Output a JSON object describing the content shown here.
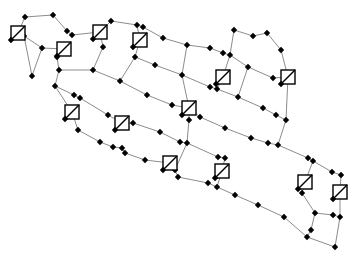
{
  "figure": {
    "width": 358,
    "height": 256,
    "background": "#ffffff",
    "kind": "network-diagram"
  },
  "style": {
    "edge_color": "#8c8c8c",
    "edge_width": 1,
    "node_color": "#000000",
    "node_half_size": 3.2,
    "sensor_size": 14,
    "sensor_fill": "#ffffff",
    "sensor_stroke": "#000000",
    "sensor_stroke_width": 1.4
  },
  "network": {
    "nodes": [
      [
        25,
        17
      ],
      [
        53,
        15
      ],
      [
        67,
        31
      ],
      [
        72,
        35
      ],
      [
        24,
        36
      ],
      [
        42,
        48
      ],
      [
        32,
        76
      ],
      [
        57,
        57
      ],
      [
        59,
        70
      ],
      [
        55,
        86
      ],
      [
        74,
        95
      ],
      [
        80,
        98
      ],
      [
        78,
        130
      ],
      [
        100,
        142
      ],
      [
        113,
        147
      ],
      [
        122,
        148
      ],
      [
        111,
        21
      ],
      [
        137,
        25
      ],
      [
        143,
        27
      ],
      [
        163,
        38
      ],
      [
        187,
        45
      ],
      [
        210,
        48
      ],
      [
        223,
        53
      ],
      [
        230,
        55
      ],
      [
        248,
        67
      ],
      [
        273,
        78
      ],
      [
        234,
        30
      ],
      [
        253,
        36
      ],
      [
        267,
        33
      ],
      [
        281,
        50
      ],
      [
        135,
        57
      ],
      [
        120,
        81
      ],
      [
        155,
        65
      ],
      [
        182,
        75
      ],
      [
        210,
        87
      ],
      [
        217,
        89
      ],
      [
        238,
        97
      ],
      [
        263,
        108
      ],
      [
        276,
        115
      ],
      [
        286,
        120
      ],
      [
        103,
        47
      ],
      [
        93,
        70
      ],
      [
        108,
        115
      ],
      [
        133,
        123
      ],
      [
        160,
        132
      ],
      [
        180,
        142
      ],
      [
        187,
        143
      ],
      [
        218,
        157
      ],
      [
        225,
        158
      ],
      [
        147,
        95
      ],
      [
        172,
        105
      ],
      [
        200,
        117
      ],
      [
        225,
        128
      ],
      [
        251,
        138
      ],
      [
        268,
        143
      ],
      [
        278,
        145
      ],
      [
        308,
        158
      ],
      [
        313,
        161
      ],
      [
        332,
        172
      ],
      [
        341,
        175
      ],
      [
        125,
        153
      ],
      [
        145,
        160
      ],
      [
        175,
        170
      ],
      [
        178,
        177
      ],
      [
        208,
        183
      ],
      [
        217,
        187
      ],
      [
        235,
        195
      ],
      [
        258,
        205
      ],
      [
        284,
        217
      ],
      [
        307,
        237
      ],
      [
        335,
        247
      ],
      [
        302,
        193
      ],
      [
        315,
        213
      ],
      [
        333,
        215
      ],
      [
        340,
        217
      ],
      [
        311,
        230
      ],
      [
        189,
        120
      ]
    ],
    "sensors": [
      [
        18,
        33
      ],
      [
        64,
        49
      ],
      [
        100,
        32
      ],
      [
        140,
        40
      ],
      [
        223,
        77
      ],
      [
        288,
        77
      ],
      [
        72,
        112
      ],
      [
        122,
        123
      ],
      [
        189,
        108
      ],
      [
        170,
        163
      ],
      [
        222,
        171
      ],
      [
        305,
        182
      ],
      [
        340,
        192
      ]
    ],
    "edges": [
      [
        "n0",
        "n1"
      ],
      [
        "n1",
        "n2"
      ],
      [
        "n2",
        "n3"
      ],
      [
        "n0",
        "s0"
      ],
      [
        "s0",
        "n4"
      ],
      [
        "n4",
        "n5"
      ],
      [
        "n4",
        "n6"
      ],
      [
        "n5",
        "n6"
      ],
      [
        "n5",
        "s1"
      ],
      [
        "n3",
        "s2"
      ],
      [
        "s2",
        "n16"
      ],
      [
        "n16",
        "n17"
      ],
      [
        "n17",
        "n18"
      ],
      [
        "n18",
        "n19"
      ],
      [
        "n19",
        "n20"
      ],
      [
        "n20",
        "n21"
      ],
      [
        "n21",
        "n22"
      ],
      [
        "n22",
        "n23"
      ],
      [
        "n23",
        "n24"
      ],
      [
        "n24",
        "n25"
      ],
      [
        "n25",
        "s5"
      ],
      [
        "n26",
        "n27"
      ],
      [
        "n27",
        "n28"
      ],
      [
        "n28",
        "n29"
      ],
      [
        "n29",
        "s5"
      ],
      [
        "n26",
        "n23"
      ],
      [
        "n23",
        "s4"
      ],
      [
        "s4",
        "n35"
      ],
      [
        "n17",
        "s3"
      ],
      [
        "s3",
        "n30"
      ],
      [
        "n30",
        "n31"
      ],
      [
        "n30",
        "n32"
      ],
      [
        "n32",
        "n33"
      ],
      [
        "n33",
        "n34"
      ],
      [
        "n34",
        "n35"
      ],
      [
        "n35",
        "n36"
      ],
      [
        "n36",
        "n37"
      ],
      [
        "n37",
        "n38"
      ],
      [
        "n38",
        "n39"
      ],
      [
        "n39",
        "n55"
      ],
      [
        "s5",
        "n39"
      ],
      [
        "s2",
        "n40"
      ],
      [
        "n40",
        "n41"
      ],
      [
        "n8",
        "n41"
      ],
      [
        "n41",
        "n31"
      ],
      [
        "s1",
        "n7"
      ],
      [
        "n7",
        "n8"
      ],
      [
        "n8",
        "n9"
      ],
      [
        "n9",
        "s6"
      ],
      [
        "s6",
        "n12"
      ],
      [
        "n12",
        "n13"
      ],
      [
        "n13",
        "n14"
      ],
      [
        "n14",
        "n15"
      ],
      [
        "n15",
        "n60"
      ],
      [
        "n60",
        "n61"
      ],
      [
        "n61",
        "s9"
      ],
      [
        "s9",
        "n62"
      ],
      [
        "n62",
        "n63"
      ],
      [
        "n63",
        "n64"
      ],
      [
        "n64",
        "n65"
      ],
      [
        "n65",
        "n66"
      ],
      [
        "n66",
        "n67"
      ],
      [
        "n67",
        "n68"
      ],
      [
        "n68",
        "n69"
      ],
      [
        "n69",
        "n70"
      ],
      [
        "n9",
        "n10"
      ],
      [
        "n10",
        "n11"
      ],
      [
        "n11",
        "n42"
      ],
      [
        "n42",
        "s7"
      ],
      [
        "s7",
        "n43"
      ],
      [
        "n43",
        "n44"
      ],
      [
        "n44",
        "n45"
      ],
      [
        "n45",
        "n46"
      ],
      [
        "n46",
        "n47"
      ],
      [
        "n47",
        "n48"
      ],
      [
        "n48",
        "s10"
      ],
      [
        "s10",
        "n65"
      ],
      [
        "n31",
        "n49"
      ],
      [
        "n49",
        "n50"
      ],
      [
        "n50",
        "s8"
      ],
      [
        "s8",
        "n51"
      ],
      [
        "n51",
        "n52"
      ],
      [
        "n52",
        "n53"
      ],
      [
        "n53",
        "n54"
      ],
      [
        "n54",
        "n55"
      ],
      [
        "n55",
        "n56"
      ],
      [
        "n56",
        "n57"
      ],
      [
        "n57",
        "n58"
      ],
      [
        "n58",
        "n59"
      ],
      [
        "n33",
        "s8"
      ],
      [
        "s8",
        "n76"
      ],
      [
        "n76",
        "n46"
      ],
      [
        "n46",
        "n62"
      ],
      [
        "n20",
        "n33"
      ],
      [
        "n24",
        "n36"
      ],
      [
        "n57",
        "s11"
      ],
      [
        "n59",
        "s12"
      ],
      [
        "s11",
        "n71"
      ],
      [
        "n71",
        "n72"
      ],
      [
        "n72",
        "n73"
      ],
      [
        "n73",
        "n74"
      ],
      [
        "s12",
        "n74"
      ],
      [
        "n72",
        "n75"
      ],
      [
        "n75",
        "n69"
      ],
      [
        "n70",
        "n74"
      ]
    ]
  }
}
